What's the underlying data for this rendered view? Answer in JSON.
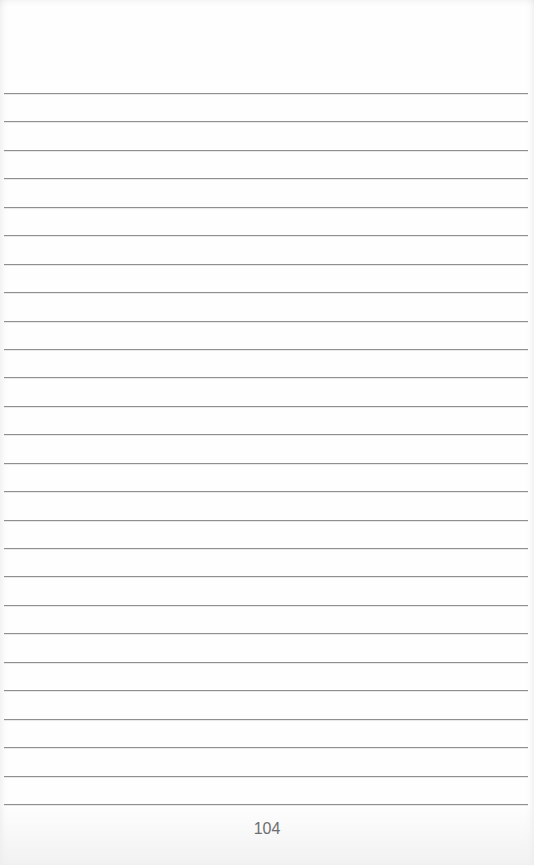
{
  "page": {
    "type": "ruled-notebook-page",
    "page_number": "104",
    "rule_count": 26,
    "first_rule_y": 93,
    "rule_spacing": 28.44,
    "rule_color": "#8f8f8f",
    "paper_color": "#fefefe"
  }
}
